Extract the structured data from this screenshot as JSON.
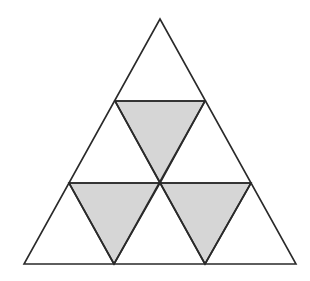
{
  "diagram": {
    "colors": {
      "background": "#ffffff",
      "stroke": "#2a2a2a",
      "shaded_fill": "#d6d6d6",
      "unshaded_fill": "#ffffff"
    },
    "stroke_width": 1.6,
    "outer_triangle": {
      "apex": [
        160,
        19
      ],
      "bottom_left": [
        24,
        264
      ],
      "bottom_right": [
        296,
        264
      ]
    },
    "grid_points": {
      "row1_left": [
        115,
        101
      ],
      "row1_right": [
        205,
        101
      ],
      "row2_left": [
        69,
        183
      ],
      "row2_center": [
        160,
        183
      ],
      "row2_right": [
        251,
        183
      ],
      "row3_a": [
        114,
        264
      ],
      "row3_b": [
        205,
        264
      ]
    },
    "small_triangle_count": 9,
    "shaded_triangle_count": 3,
    "shaded_triangles": [
      {
        "id": "shaded-top",
        "points": [
          [
            115,
            101
          ],
          [
            205,
            101
          ],
          [
            160,
            183
          ]
        ]
      },
      {
        "id": "shaded-bottom-left",
        "points": [
          [
            69,
            183
          ],
          [
            160,
            183
          ],
          [
            114,
            264
          ]
        ]
      },
      {
        "id": "shaded-bottom-right",
        "points": [
          [
            160,
            183
          ],
          [
            251,
            183
          ],
          [
            205,
            264
          ]
        ]
      }
    ]
  }
}
